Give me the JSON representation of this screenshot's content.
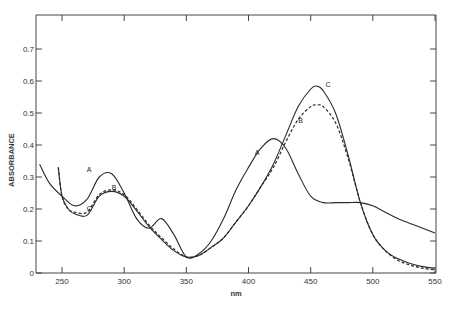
{
  "chart_data": {
    "type": "line",
    "title": "",
    "xlabel": "nm",
    "ylabel": "ABSORBANCE",
    "xlim": [
      230,
      550
    ],
    "ylim": [
      0,
      0.8
    ],
    "grid": false,
    "legend_position": "inline curve labels",
    "x_ticks": [
      "250",
      "300",
      "350",
      "400",
      "450",
      "500",
      "550"
    ],
    "y_ticks": [
      "0",
      "0.1",
      "0.2",
      "0.3",
      "0.4",
      "0.5",
      "0.6",
      "0.7"
    ],
    "series": [
      {
        "name": "A",
        "style": "solid",
        "x": [
          232,
          240,
          250,
          260,
          270,
          280,
          290,
          300,
          310,
          320,
          330,
          340,
          350,
          360,
          370,
          380,
          390,
          400,
          410,
          420,
          430,
          440,
          450,
          460,
          470,
          480,
          490,
          500,
          510,
          520,
          530,
          540,
          550
        ],
        "y": [
          0.34,
          0.28,
          0.24,
          0.21,
          0.23,
          0.3,
          0.31,
          0.25,
          0.17,
          0.14,
          0.17,
          0.12,
          0.05,
          0.06,
          0.1,
          0.17,
          0.26,
          0.33,
          0.39,
          0.42,
          0.39,
          0.31,
          0.24,
          0.22,
          0.22,
          0.22,
          0.22,
          0.21,
          0.19,
          0.17,
          0.155,
          0.14,
          0.125
        ]
      },
      {
        "name": "B",
        "style": "dashed",
        "x": [
          247,
          250,
          255,
          260,
          270,
          280,
          290,
          300,
          310,
          320,
          330,
          340,
          350,
          360,
          370,
          380,
          390,
          400,
          410,
          420,
          430,
          440,
          450,
          455,
          460,
          470,
          480,
          490,
          500,
          510,
          520,
          530,
          540,
          550
        ],
        "y": [
          0.33,
          0.24,
          0.2,
          0.19,
          0.19,
          0.245,
          0.26,
          0.245,
          0.2,
          0.15,
          0.11,
          0.075,
          0.05,
          0.055,
          0.08,
          0.11,
          0.16,
          0.21,
          0.27,
          0.33,
          0.41,
          0.48,
          0.52,
          0.525,
          0.52,
          0.47,
          0.36,
          0.22,
          0.12,
          0.07,
          0.04,
          0.025,
          0.015,
          0.01
        ]
      },
      {
        "name": "C",
        "style": "solid",
        "x": [
          247,
          250,
          255,
          260,
          270,
          280,
          290,
          300,
          310,
          320,
          330,
          340,
          350,
          360,
          370,
          380,
          390,
          400,
          410,
          420,
          430,
          440,
          450,
          455,
          460,
          470,
          480,
          490,
          500,
          510,
          520,
          530,
          540,
          550
        ],
        "y": [
          0.33,
          0.24,
          0.2,
          0.185,
          0.18,
          0.24,
          0.255,
          0.24,
          0.195,
          0.145,
          0.105,
          0.07,
          0.05,
          0.055,
          0.08,
          0.11,
          0.16,
          0.21,
          0.27,
          0.34,
          0.43,
          0.52,
          0.575,
          0.584,
          0.57,
          0.5,
          0.37,
          0.22,
          0.12,
          0.07,
          0.045,
          0.03,
          0.02,
          0.015
        ]
      }
    ],
    "annotations": [
      {
        "text": "A",
        "x": 270,
        "y": 0.315
      },
      {
        "text": "B",
        "x": 290,
        "y": 0.26
      },
      {
        "text": "C",
        "x": 270,
        "y": 0.195
      },
      {
        "text": "A",
        "x": 405,
        "y": 0.37
      },
      {
        "text": "B",
        "x": 440,
        "y": 0.47
      },
      {
        "text": "C",
        "x": 462,
        "y": 0.58
      }
    ]
  }
}
